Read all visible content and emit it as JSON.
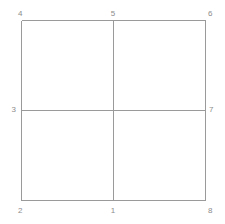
{
  "diagram": {
    "type": "grid-node-diagram",
    "background_color": "#ffffff",
    "line_color": "#9a9a9a",
    "label_color": "#8c8c8c",
    "line_width": 1,
    "grid": {
      "columns": 2,
      "rows": 2,
      "left": 21,
      "top": 20,
      "right": 205,
      "bottom": 200,
      "center_x": 113,
      "center_y": 110,
      "width": 184,
      "height": 180
    },
    "nodes": [
      {
        "id": "node-1",
        "label": "1",
        "position": "bottom-center",
        "x": 113,
        "y": 200,
        "label_x": 113,
        "label_y": 207,
        "anchor": "center"
      },
      {
        "id": "node-2",
        "label": "2",
        "position": "bottom-left",
        "x": 21,
        "y": 200,
        "label_x": 18,
        "label_y": 207,
        "anchor": "left"
      },
      {
        "id": "node-3",
        "label": "3",
        "position": "left-center",
        "x": 21,
        "y": 110,
        "label_x": 16,
        "label_y": 110,
        "anchor": "middle-right"
      },
      {
        "id": "node-4",
        "label": "4",
        "position": "top-left",
        "x": 21,
        "y": 20,
        "label_x": 18,
        "label_y": 10,
        "anchor": "left"
      },
      {
        "id": "node-5",
        "label": "5",
        "position": "top-center",
        "x": 113,
        "y": 20,
        "label_x": 113,
        "label_y": 10,
        "anchor": "center"
      },
      {
        "id": "node-6",
        "label": "6",
        "position": "top-right",
        "x": 205,
        "y": 20,
        "label_x": 208,
        "label_y": 10,
        "anchor": "left"
      },
      {
        "id": "node-7",
        "label": "7",
        "position": "right-center",
        "x": 205,
        "y": 110,
        "label_x": 209,
        "label_y": 110,
        "anchor": "middle"
      },
      {
        "id": "node-8",
        "label": "8",
        "position": "bottom-right",
        "x": 205,
        "y": 200,
        "label_x": 208,
        "label_y": 207,
        "anchor": "left"
      }
    ],
    "edges": [
      {
        "id": "edge-top",
        "from": "node-4",
        "to": "node-6",
        "orientation": "horizontal",
        "x1": 21,
        "y1": 20,
        "x2": 205,
        "y2": 20
      },
      {
        "id": "edge-bottom",
        "from": "node-2",
        "to": "node-8",
        "orientation": "horizontal",
        "x1": 21,
        "y1": 200,
        "x2": 205,
        "y2": 200
      },
      {
        "id": "edge-left",
        "from": "node-4",
        "to": "node-2",
        "orientation": "vertical",
        "x1": 21,
        "y1": 20,
        "x2": 21,
        "y2": 200
      },
      {
        "id": "edge-right",
        "from": "node-6",
        "to": "node-8",
        "orientation": "vertical",
        "x1": 205,
        "y1": 20,
        "x2": 205,
        "y2": 200
      },
      {
        "id": "edge-mid-horiz",
        "from": "node-3",
        "to": "node-7",
        "orientation": "horizontal",
        "x1": 21,
        "y1": 110,
        "x2": 205,
        "y2": 110
      },
      {
        "id": "edge-mid-vert",
        "from": "node-5",
        "to": "node-1",
        "orientation": "vertical",
        "x1": 113,
        "y1": 20,
        "x2": 113,
        "y2": 200
      }
    ]
  }
}
